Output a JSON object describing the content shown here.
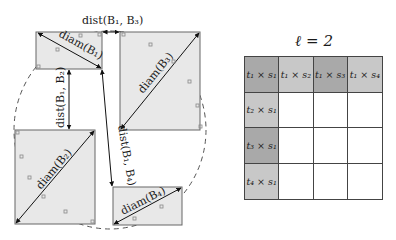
{
  "diagram": {
    "boxes": [
      {
        "id": "B1",
        "diam_label": "diam(B₁)"
      },
      {
        "id": "B2",
        "diam_label": "diam(B₂)"
      },
      {
        "id": "B3",
        "diam_label": "diam(B₃)"
      },
      {
        "id": "B4",
        "diam_label": "diam(B₄)"
      }
    ],
    "distances": [
      {
        "label": "dist(B₁, B₃)"
      },
      {
        "label": "dist(B₁, B₂)"
      },
      {
        "label": "dist(B₁, B₄)"
      }
    ]
  },
  "table": {
    "title": "ℓ = 2",
    "rows": [
      [
        {
          "text": "t₁ × s₁",
          "fill": "#a9a9a9"
        },
        {
          "text": "t₁ × s₂",
          "fill": "#c8c8c8"
        },
        {
          "text": "t₁ × s₃",
          "fill": "#a9a9a9"
        },
        {
          "text": "t₁ × s₄",
          "fill": "#c8c8c8"
        }
      ],
      [
        {
          "text": "t₂ × s₁",
          "fill": "#c8c8c8"
        },
        {
          "text": "",
          "fill": "#ffffff"
        },
        {
          "text": "",
          "fill": "#ffffff"
        },
        {
          "text": "",
          "fill": "#ffffff"
        }
      ],
      [
        {
          "text": "t₃ × s₁",
          "fill": "#a9a9a9"
        },
        {
          "text": "",
          "fill": "#ffffff"
        },
        {
          "text": "",
          "fill": "#ffffff"
        },
        {
          "text": "",
          "fill": "#ffffff"
        }
      ],
      [
        {
          "text": "t₄ × s₁",
          "fill": "#c8c8c8"
        },
        {
          "text": "",
          "fill": "#ffffff"
        },
        {
          "text": "",
          "fill": "#ffffff"
        },
        {
          "text": "",
          "fill": "#ffffff"
        }
      ]
    ]
  },
  "colors": {
    "box_fill": "#e8e8e8",
    "box_stroke": "#666666",
    "dark_cell": "#a9a9a9",
    "light_cell": "#c8c8c8"
  }
}
